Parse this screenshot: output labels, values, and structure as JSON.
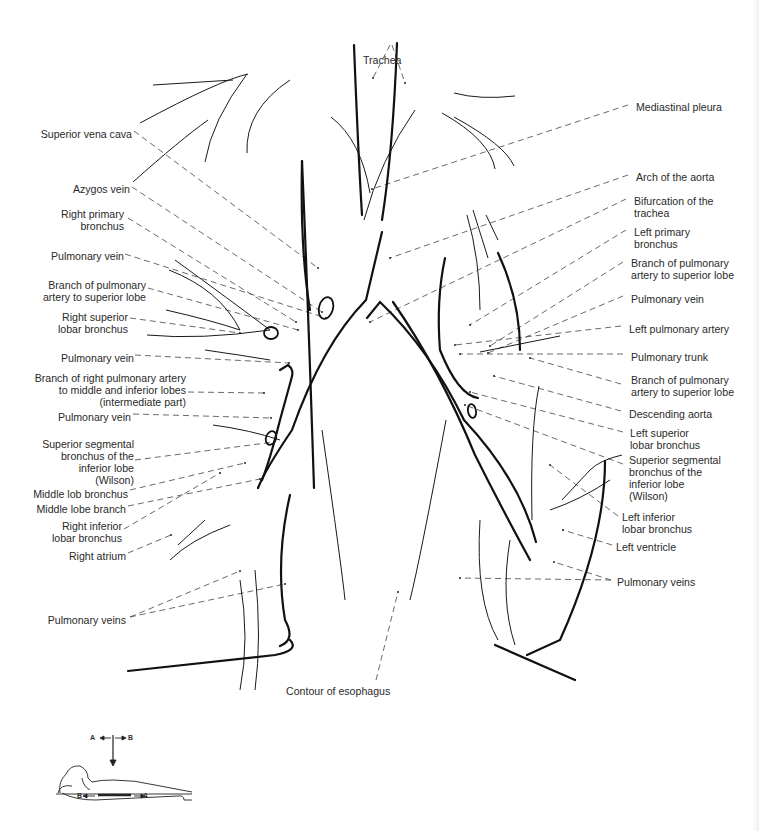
{
  "figure": {
    "type": "anatomical-diagram"
  },
  "labels_left": [
    {
      "id": "superior-vena-cava",
      "text": "Superior vena cava",
      "x": 40,
      "y": 128,
      "w": 92
    },
    {
      "id": "azygos-vein",
      "text": "Azygos vein",
      "x": 60,
      "y": 183,
      "w": 70
    },
    {
      "id": "right-primary-bronchus",
      "text": "Right primary\nbronchus",
      "x": 50,
      "y": 208,
      "w": 74
    },
    {
      "id": "pulmonary-vein-1",
      "text": "Pulmonary vein",
      "x": 30,
      "y": 250,
      "w": 94
    },
    {
      "id": "branch-pulmonary-artery-superior-lobe-right",
      "text": "Branch of pulmonary\nartery to superior lobe",
      "x": 20,
      "y": 279,
      "w": 126
    },
    {
      "id": "right-superior-lobar-bronchus",
      "text": "Right superior\nlobar bronchus",
      "x": 40,
      "y": 311,
      "w": 88
    },
    {
      "id": "pulmonary-vein-2",
      "text": "Pulmonary vein",
      "x": 30,
      "y": 352,
      "w": 104
    },
    {
      "id": "branch-right-pulmonary-artery",
      "text": "Branch of right pulmonary artery\nto middle and inferior lobes\n(intermediate part)",
      "x": 10,
      "y": 372,
      "w": 176
    },
    {
      "id": "pulmonary-vein-3",
      "text": "Pulmonary vein",
      "x": 30,
      "y": 411,
      "w": 101
    },
    {
      "id": "superior-segmental-bronchus-right",
      "text": "Superior segmental\nbronchus of the\ninferior lobe\n(Wilson)",
      "x": 20,
      "y": 438,
      "w": 114
    },
    {
      "id": "middle-lob-bronchus",
      "text": "Middle lob bronchus",
      "x": 10,
      "y": 488,
      "w": 118
    },
    {
      "id": "middle-lobe-branch",
      "text": "Middle lobe branch",
      "x": 10,
      "y": 503,
      "w": 116
    },
    {
      "id": "right-inferior-lobar-bronchus",
      "text": "Right inferior\nlobar bronchus",
      "x": 30,
      "y": 520,
      "w": 92
    },
    {
      "id": "right-atrium",
      "text": "Right atrium",
      "x": 40,
      "y": 550,
      "w": 86
    },
    {
      "id": "pulmonary-veins-left-side",
      "text": "Pulmonary veins",
      "x": 20,
      "y": 614,
      "w": 106
    }
  ],
  "labels_right": [
    {
      "id": "mediastinal-pleura",
      "text": "Mediastinal pleura",
      "x": 636,
      "y": 101
    },
    {
      "id": "arch-of-aorta",
      "text": "Arch of the aorta",
      "x": 636,
      "y": 171
    },
    {
      "id": "bifurcation-of-trachea",
      "text": "Bifurcation of the\ntrachea",
      "x": 634,
      "y": 195
    },
    {
      "id": "left-primary-bronchus",
      "text": "Left primary\nbronchus",
      "x": 634,
      "y": 226
    },
    {
      "id": "branch-pulmonary-artery-superior-lobe-left-1",
      "text": "Branch of pulmonary\nartery to superior lobe",
      "x": 631,
      "y": 257
    },
    {
      "id": "pulmonary-vein-right-side",
      "text": "Pulmonary vein",
      "x": 631,
      "y": 293
    },
    {
      "id": "left-pulmonary-artery",
      "text": "Left pulmonary artery",
      "x": 629,
      "y": 323
    },
    {
      "id": "pulmonary-trunk",
      "text": "Pulmonary trunk",
      "x": 631,
      "y": 351
    },
    {
      "id": "branch-pulmonary-artery-superior-lobe-left-2",
      "text": "Branch of pulmonary\nartery to superior lobe",
      "x": 631,
      "y": 374
    },
    {
      "id": "descending-aorta",
      "text": "Descending aorta",
      "x": 629,
      "y": 408
    },
    {
      "id": "left-superior-lobar-bronchus",
      "text": "Left superior\nlobar bronchus",
      "x": 630,
      "y": 427
    },
    {
      "id": "superior-segmental-bronchus-left",
      "text": "Superior segmental\nbronchus of the\ninferior lobe\n(Wilson)",
      "x": 629,
      "y": 454
    },
    {
      "id": "left-inferior-lobar-bronchus",
      "text": "Left inferior\nlobar bronchus",
      "x": 622,
      "y": 511
    },
    {
      "id": "left-ventricle",
      "text": "Left ventricle",
      "x": 616,
      "y": 541
    },
    {
      "id": "pulmonary-veins-right-side",
      "text": "Pulmonary veins",
      "x": 617,
      "y": 576
    }
  ],
  "labels_center": [
    {
      "id": "trachea",
      "text": "Trachea",
      "x": 363,
      "y": 54
    },
    {
      "id": "contour-of-esophagus",
      "text": "Contour of esophagus",
      "x": 286,
      "y": 685
    }
  ],
  "orientation_inset": {
    "top_left": "A",
    "top_right": "B",
    "bottom_left": "B",
    "bottom_right": "A",
    "description": "Supine patient with vertical beam arrow and tomographic sweep A-B"
  },
  "leader_lines": [
    [
      134,
      131,
      318,
      268
    ],
    [
      132,
      187,
      322,
      312
    ],
    [
      128,
      218,
      296,
      322
    ],
    [
      125,
      254,
      326,
      318
    ],
    [
      148,
      288,
      298,
      330
    ],
    [
      130,
      318,
      240,
      333
    ],
    [
      135,
      355,
      289,
      363
    ],
    [
      188,
      392,
      264,
      393
    ],
    [
      133,
      414,
      271,
      418
    ],
    [
      135,
      460,
      274,
      442
    ],
    [
      130,
      490,
      245,
      463
    ],
    [
      128,
      506,
      260,
      479
    ],
    [
      124,
      529,
      220,
      473
    ],
    [
      128,
      553,
      171,
      535
    ],
    [
      130,
      617,
      240,
      571
    ],
    [
      130,
      617,
      285,
      584
    ],
    [
      628,
      105,
      372,
      189
    ],
    [
      628,
      175,
      390,
      258
    ],
    [
      626,
      199,
      370,
      322
    ],
    [
      626,
      230,
      470,
      325
    ],
    [
      623,
      262,
      490,
      346
    ],
    [
      623,
      296,
      488,
      353
    ],
    [
      621,
      326,
      455,
      345
    ],
    [
      623,
      354,
      460,
      354
    ],
    [
      621,
      384,
      530,
      358
    ],
    [
      621,
      411,
      494,
      376
    ],
    [
      623,
      432,
      470,
      392
    ],
    [
      623,
      464,
      465,
      405
    ],
    [
      618,
      516,
      550,
      465
    ],
    [
      612,
      545,
      563,
      530
    ],
    [
      611,
      580,
      460,
      578
    ],
    [
      611,
      580,
      554,
      562
    ],
    [
      390,
      45,
      373,
      78
    ],
    [
      392,
      45,
      405,
      83
    ],
    [
      376,
      680,
      398,
      592
    ]
  ],
  "anatomy_paths": {
    "thick": [
      "M302,161 Q308,300 314,488",
      "M397,43 Q393,150 382,220",
      "M354,45 Q358,150 362,215",
      "M382,232 L366,300 Q322,345 292,430 Q265,470 258,488",
      "M367,318 L380,302 Q430,350 464,420 Q520,480 536,542",
      "M393,302 Q440,370 475,455 Q500,505 530,560",
      "M445,258 Q436,300 440,350 Q458,395 478,398",
      "M302,161 Q300,250 310,310",
      "M280,370 L288,365 Q295,370 291,380 L280,420 Q270,460 262,480",
      "M128,671 Q210,662 275,655 Q300,650 290,640",
      "M495,645 L575,680",
      "M605,461 Q605,540 560,640 L527,655",
      "M290,495 Q275,560 285,620 Q296,640 280,646",
      "M498,253 Q520,300 520,350"
    ],
    "thin": [
      "M140,123 Q220,80 248,74",
      "M133,182 Q180,140 208,120",
      "M247,74 Q212,120 205,162",
      "M290,80 Q245,110 247,153",
      "M331,117 Q361,140 370,193",
      "M454,117 Q505,145 514,166",
      "M442,113 Q490,140 495,169",
      "M454,93 Q480,100 515,96",
      "M415,110 Q380,160 364,220",
      "M153,85 L233,80",
      "M467,215 Q480,260 480,310",
      "M473,210 L488,258",
      "M486,215 L498,240",
      "M169,270 Q220,290 240,330",
      "M175,260 Q230,300 270,330",
      "M147,335 Q200,340 270,330",
      "M166,310 Q210,320 240,330",
      "M205,350 Q240,355 270,360",
      "M213,425 Q250,430 280,440",
      "M480,352 L560,336",
      "M539,386 Q530,430 532,520",
      "M562,500 L590,470 Q600,460 622,455",
      "M550,510 Q580,500 610,480",
      "M170,560 Q190,540 230,525",
      "M178,545 L205,520",
      "M240,690 Q250,640 240,580",
      "M255,690 Q262,640 255,570",
      "M345,600 Q342,570 322,430",
      "M410,600 Q420,560 446,420",
      "M498,640 Q475,600 480,520",
      "M515,645 Q500,600 510,540"
    ],
    "ellipses": [
      {
        "cx": 326,
        "cy": 308,
        "rx": 7,
        "ry": 11,
        "rot": 15
      },
      {
        "cx": 271,
        "cy": 333,
        "rx": 7,
        "ry": 6,
        "rot": 0
      },
      {
        "cx": 271,
        "cy": 438,
        "rx": 5,
        "ry": 7,
        "rot": 20
      },
      {
        "cx": 472,
        "cy": 411,
        "rx": 4,
        "ry": 7,
        "rot": -10
      }
    ]
  }
}
